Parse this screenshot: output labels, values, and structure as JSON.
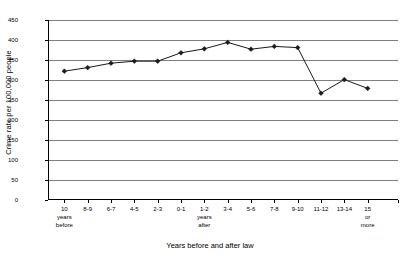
{
  "chart_data": {
    "type": "line",
    "title": "",
    "xlabel": "Years before and after law",
    "ylabel": "Crime rate per 100,000 people",
    "ylim": [
      0,
      450
    ],
    "ytick_step": 50,
    "yticks": [
      0,
      50,
      100,
      150,
      200,
      250,
      300,
      350,
      400,
      450
    ],
    "grid": true,
    "legend": "none",
    "categories": [
      "10 years before",
      "8-9",
      "6-7",
      "4-5",
      "2-3",
      "0-1",
      "1-2 years after",
      "3-4",
      "5-6",
      "7-8",
      "9-10",
      "11-12",
      "13-14",
      "15 or more"
    ],
    "category_lines": [
      [
        "10",
        "years",
        "before"
      ],
      [
        "8-9"
      ],
      [
        "6-7"
      ],
      [
        "4-5"
      ],
      [
        "2-3"
      ],
      [
        "0-1"
      ],
      [
        "1-2",
        "years",
        "after"
      ],
      [
        "3-4"
      ],
      [
        "5-6"
      ],
      [
        "7-8"
      ],
      [
        "9-10"
      ],
      [
        "11-12"
      ],
      [
        "13-14"
      ],
      [
        "15",
        "or",
        "more"
      ]
    ],
    "values": [
      322,
      331,
      342,
      347,
      347,
      368,
      378,
      394,
      377,
      384,
      381,
      267,
      301,
      279
    ],
    "series": [
      {
        "name": "Crime rate",
        "values": [
          322,
          331,
          342,
          347,
          347,
          368,
          378,
          394,
          377,
          384,
          381,
          267,
          301,
          279
        ],
        "color": "#1a1a1a",
        "marker": "diamond"
      }
    ],
    "colors": {
      "line": "#1a1a1a",
      "grid": "#7f7f7f",
      "axis": "#000000",
      "background": "#ffffff"
    }
  }
}
